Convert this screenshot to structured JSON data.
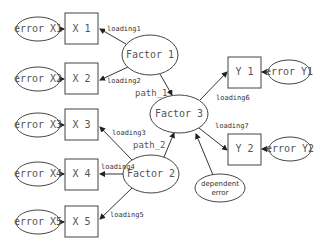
{
  "diagram": {
    "type": "structural-equation-model",
    "nodes": [
      {
        "id": "eX1",
        "label": "error X1",
        "kind": "error"
      },
      {
        "id": "X1",
        "label": "X 1",
        "kind": "observed"
      },
      {
        "id": "eX2",
        "label": "error X2",
        "kind": "error"
      },
      {
        "id": "X2",
        "label": "X 2",
        "kind": "observed"
      },
      {
        "id": "eX3",
        "label": "error X3",
        "kind": "error"
      },
      {
        "id": "X3",
        "label": "X 3",
        "kind": "observed"
      },
      {
        "id": "eX4",
        "label": "error X4",
        "kind": "error"
      },
      {
        "id": "X4",
        "label": "X 4",
        "kind": "observed"
      },
      {
        "id": "eX5",
        "label": "error X5",
        "kind": "error"
      },
      {
        "id": "X5",
        "label": "X 5",
        "kind": "observed"
      },
      {
        "id": "F1",
        "label": "Factor 1",
        "kind": "latent"
      },
      {
        "id": "F2",
        "label": "Factor 2",
        "kind": "latent"
      },
      {
        "id": "F3",
        "label": "Factor 3",
        "kind": "latent"
      },
      {
        "id": "Y1",
        "label": "Y 1",
        "kind": "observed"
      },
      {
        "id": "Y2",
        "label": "Y 2",
        "kind": "observed"
      },
      {
        "id": "eY1",
        "label": "error Y1",
        "kind": "error"
      },
      {
        "id": "eY2",
        "label": "error Y2",
        "kind": "error"
      },
      {
        "id": "dErr",
        "label_line1": "dependent",
        "label_line2": "error",
        "kind": "error"
      }
    ],
    "edges": [
      {
        "from": "F1",
        "to": "X1",
        "label": "loading1"
      },
      {
        "from": "F1",
        "to": "X2",
        "label": "loading2"
      },
      {
        "from": "F2",
        "to": "X3",
        "label": "loading3"
      },
      {
        "from": "F2",
        "to": "X4",
        "label": "loading4"
      },
      {
        "from": "F2",
        "to": "X5",
        "label": "loading5"
      },
      {
        "from": "F3",
        "to": "Y1",
        "label": "loading6"
      },
      {
        "from": "F3",
        "to": "Y2",
        "label": "loading7"
      },
      {
        "from": "F1",
        "to": "F3",
        "label": "path_1"
      },
      {
        "from": "F2",
        "to": "F3",
        "label": "path_2"
      },
      {
        "from": "dErr",
        "to": "F3",
        "label": ""
      },
      {
        "from": "eX1",
        "to": "X1",
        "label": ""
      },
      {
        "from": "eX2",
        "to": "X2",
        "label": ""
      },
      {
        "from": "eX3",
        "to": "X3",
        "label": ""
      },
      {
        "from": "eX4",
        "to": "X4",
        "label": ""
      },
      {
        "from": "eX5",
        "to": "X5",
        "label": ""
      },
      {
        "from": "eY1",
        "to": "Y1",
        "label": ""
      },
      {
        "from": "eY2",
        "to": "Y2",
        "label": ""
      }
    ],
    "labels": {
      "eX1": "error X1",
      "X1": "X 1",
      "eX2": "error X2",
      "X2": "X 2",
      "eX3": "error X3",
      "X3": "X 3",
      "eX4": "error X4",
      "X4": "X 4",
      "eX5": "error X5",
      "X5": "X 5",
      "F1": "Factor 1",
      "F2": "Factor 2",
      "F3": "Factor 3",
      "Y1": "Y 1",
      "Y2": "Y 2",
      "eY1": "error Y1",
      "eY2": "error Y2",
      "dErr1": "dependent",
      "dErr2": "error",
      "loading1": "loading1",
      "loading2": "loading2",
      "loading3": "loading3",
      "loading4": "loading4",
      "loading5": "loading5",
      "loading6": "loading6",
      "loading7": "loading7",
      "path1": "path_1",
      "path2": "path_2"
    }
  }
}
